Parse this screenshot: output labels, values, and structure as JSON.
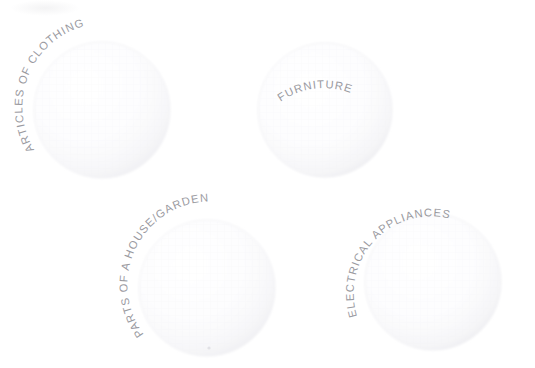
{
  "diagram": {
    "type": "venn-like-circles",
    "title": "",
    "background_color": "#ffffff",
    "label_color": "#9a9a9f",
    "circle_fill_color": "#fdfdfd",
    "circle_edge_color": "#f0f0f2",
    "circles": [
      {
        "id": "articles-of-clothing",
        "label": "ARTICLES OF CLOTHING",
        "cx": 102,
        "cy": 110,
        "r": 68,
        "label_arc_start_angle": -205,
        "label_arc_sweep": 1
      },
      {
        "id": "furniture",
        "label": "FURNITURE",
        "cx": 325,
        "cy": 110,
        "r": 67,
        "label_arc_start_angle": -160,
        "label_arc_sweep": 1
      },
      {
        "id": "parts-of-a-house-garden",
        "label": "PARTS OF A HOUSE/GARDEN",
        "cx": 207,
        "cy": 288,
        "r": 68,
        "label_arc_start_angle": -205,
        "label_arc_sweep": 1
      },
      {
        "id": "electrical-appliances",
        "label": "ELECTRICAL APPLIANCES",
        "cx": 433,
        "cy": 282,
        "r": 68,
        "label_arc_start_angle": -200,
        "label_arc_sweep": 1
      }
    ]
  }
}
